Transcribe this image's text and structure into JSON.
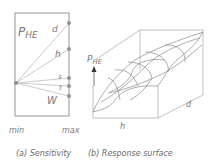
{
  "panel_a": {
    "title": "P",
    "title_sub": "HE",
    "params": [
      "d",
      "h",
      "s",
      "t",
      "W"
    ],
    "axis_min": "min",
    "axis_max": "max",
    "caption": "(a) Sensitivity"
  },
  "panel_b": {
    "axis_label": "P",
    "axis_label_sub": "HE",
    "x_label": "h",
    "y_label": "d",
    "caption": "(b) Response surface"
  },
  "colors": {
    "line": "#9a9a9a",
    "dot": "#8a8a8a",
    "text": "#7a7a7a"
  }
}
